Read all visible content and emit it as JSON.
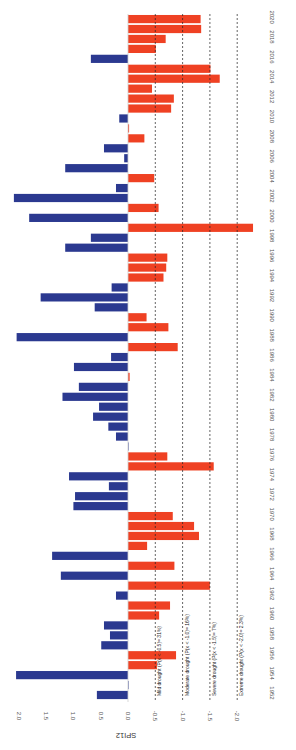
{
  "chart_data": {
    "type": "bar",
    "orientation": "rotated-90",
    "title": "",
    "xlabel": "",
    "ylabel": "SPI12",
    "ylim": [
      -2.0,
      2.0
    ],
    "yticks": [
      "2.0",
      "1.5",
      "1.0",
      "0.5",
      "0.0",
      "-0.5",
      "-1.0",
      "-1.5",
      "-2.0"
    ],
    "ytick_values": [
      2.0,
      1.5,
      1.0,
      0.5,
      0.0,
      -0.5,
      -1.0,
      -1.5,
      -2.0
    ],
    "xtick_labels": [
      "1952",
      "1954",
      "1956",
      "1958",
      "1960",
      "1962",
      "1964",
      "1966",
      "1968",
      "1970",
      "1972",
      "1974",
      "1976",
      "1978",
      "1980",
      "1982",
      "1984",
      "1986",
      "1988",
      "1990",
      "1992",
      "1994",
      "1996",
      "1998",
      "2000",
      "2002",
      "2004",
      "2006",
      "2008",
      "2010",
      "2012",
      "2014",
      "2016",
      "2018",
      "2020"
    ],
    "grid": false,
    "colors": {
      "positive": "#2b3990",
      "negative": "#ef4123"
    },
    "categories": [
      1952,
      1953,
      1954,
      1955,
      1956,
      1957,
      1958,
      1959,
      1960,
      1961,
      1962,
      1963,
      1964,
      1965,
      1966,
      1967,
      1968,
      1969,
      1970,
      1971,
      1972,
      1973,
      1974,
      1975,
      1976,
      1977,
      1978,
      1979,
      1980,
      1981,
      1982,
      1983,
      1984,
      1985,
      1986,
      1987,
      1988,
      1989,
      1990,
      1991,
      1992,
      1993,
      1994,
      1995,
      1996,
      1997,
      1998,
      1999,
      2000,
      2001,
      2002,
      2003,
      2004,
      2005,
      2006,
      2007,
      2008,
      2009,
      2010,
      2011,
      2012,
      2013,
      2014,
      2015,
      2016,
      2017,
      2018,
      2019,
      2020
    ],
    "values": [
      0.57,
      0.0,
      2.05,
      -0.53,
      -0.88,
      0.49,
      0.33,
      0.44,
      -0.57,
      -0.77,
      0.22,
      -1.5,
      1.23,
      -0.85,
      1.39,
      -0.35,
      -1.3,
      -1.21,
      -0.82,
      1.0,
      0.97,
      0.35,
      1.08,
      -1.57,
      -0.72,
      0.0,
      0.22,
      0.36,
      0.64,
      0.53,
      1.2,
      0.9,
      -0.03,
      0.99,
      0.31,
      -0.91,
      2.04,
      -0.74,
      -0.34,
      0.61,
      1.6,
      0.3,
      -0.65,
      -0.7,
      -0.72,
      1.15,
      0.68,
      -2.29,
      1.81,
      -0.56,
      2.09,
      0.22,
      -0.48,
      1.15,
      0.07,
      0.44,
      -0.3,
      -0.02,
      0.16,
      -0.79,
      -0.84,
      -0.44,
      -1.68,
      -1.51,
      0.68,
      -0.51,
      -0.69,
      -1.34,
      -1.33
    ],
    "reference_lines": [
      {
        "value": -0.5,
        "style": "dashed",
        "label": "Mild drought (P(x < -0.5)= 31%)"
      },
      {
        "value": -1.0,
        "style": "dashed",
        "label": "Moderate drought (P(x < -1.0)= 16%)"
      },
      {
        "value": -1.5,
        "style": "dashed",
        "label": "Severe drought (P(x < -1.5)= 7%)"
      },
      {
        "value": -2.0,
        "style": "dashed",
        "label": "Extreme drought (P(x < -2.0)= 2.3%)"
      }
    ]
  }
}
